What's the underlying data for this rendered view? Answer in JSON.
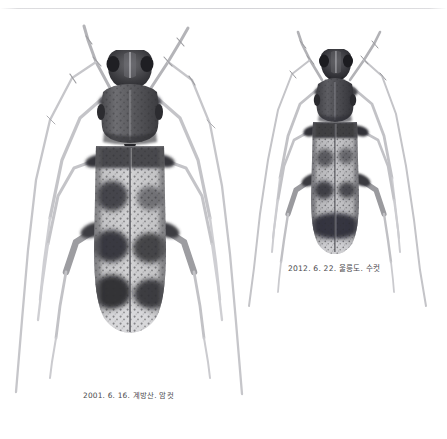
{
  "plate": {
    "title": "Beetle specimen comparison plate",
    "background_color": "#ffffff",
    "width": 447,
    "height": 439,
    "ink_color": "#4a4a4d",
    "edge_line_color": "#d0d0d4"
  },
  "specimens": [
    {
      "id": "specimen-left",
      "position": "left",
      "caption": "2001. 6. 16. 계방산. 암컷",
      "date": "2001. 6. 16.",
      "locality": "계방산",
      "sex": "암컷",
      "description": "longhorn beetle dorsal view, banded mottled elytra, long antennae"
    },
    {
      "id": "specimen-right",
      "position": "right",
      "caption": "2012. 6. 22. 울릉도. 수컷",
      "date": "2012. 6. 22.",
      "locality": "울릉도",
      "sex": "수컷",
      "description": "longhorn beetle dorsal view, smaller, darker elytra, long antennae"
    }
  ]
}
